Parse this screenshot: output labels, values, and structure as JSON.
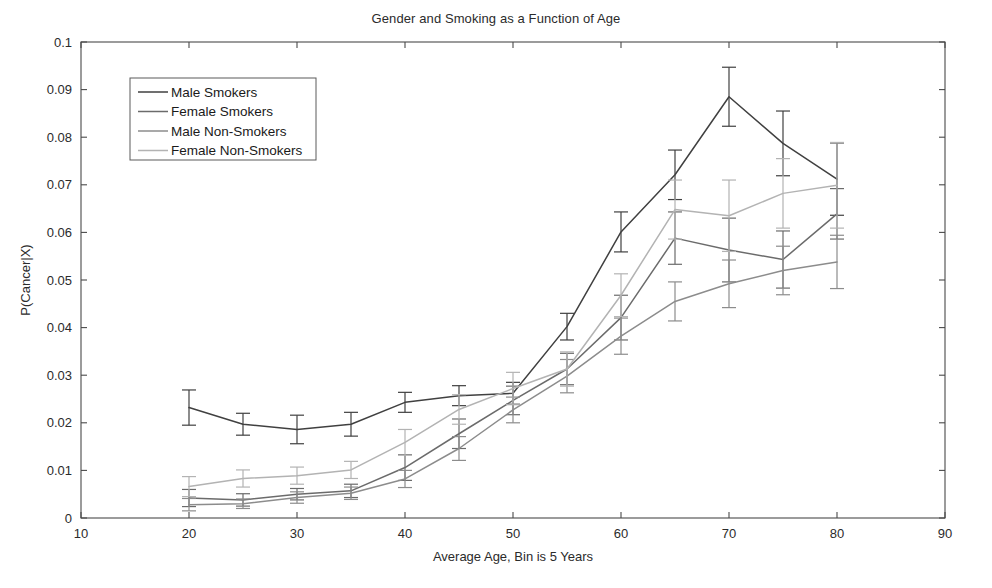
{
  "chart_data": {
    "type": "line",
    "title": "Gender and Smoking as a Function of Age",
    "xlabel": "Average Age, Bin is 5 Years",
    "ylabel": "P(Cancer|X)",
    "xlim": [
      10,
      90
    ],
    "ylim": [
      0,
      0.1
    ],
    "xticks": [
      10,
      20,
      30,
      40,
      50,
      60,
      70,
      80,
      90
    ],
    "yticks": [
      0,
      0.01,
      0.02,
      0.03,
      0.04,
      0.05,
      0.06,
      0.07,
      0.08,
      0.09,
      0.1
    ],
    "xtick_labels": [
      "10",
      "20",
      "30",
      "40",
      "50",
      "60",
      "70",
      "80",
      "90"
    ],
    "ytick_labels": [
      "0",
      "0.01",
      "0.02",
      "0.03",
      "0.04",
      "0.05",
      "0.06",
      "0.07",
      "0.08",
      "0.09",
      "0.1"
    ],
    "grid": false,
    "legend_position": "upper left",
    "errorbars": true,
    "x": [
      20,
      25,
      30,
      35,
      40,
      45,
      50,
      55,
      60,
      65,
      70,
      75,
      80
    ],
    "series": [
      {
        "name": "Male Smokers",
        "color": "#404040",
        "values": [
          0.0232,
          0.0197,
          0.0186,
          0.0197,
          0.0243,
          0.0257,
          0.0262,
          0.0402,
          0.0601,
          0.0721,
          0.0885,
          0.0787,
          0.0712
        ],
        "errors": [
          0.0037,
          0.0023,
          0.003,
          0.0025,
          0.0021,
          0.0021,
          0.0023,
          0.0028,
          0.0042,
          0.0052,
          0.0062,
          0.0068,
          0.0076
        ]
      },
      {
        "name": "Female Smokers",
        "color": "#6b6b6b",
        "values": [
          0.0042,
          0.0038,
          0.005,
          0.0057,
          0.0106,
          0.0177,
          0.0247,
          0.0313,
          0.0421,
          0.0588,
          0.0563,
          0.0543,
          0.0639
        ],
        "errors": [
          0.0018,
          0.0013,
          0.0012,
          0.0014,
          0.0027,
          0.0031,
          0.003,
          0.0033,
          0.0047,
          0.0055,
          0.0067,
          0.006,
          0.0053
        ]
      },
      {
        "name": "Male Non-Smokers",
        "color": "#8c8c8c",
        "values": [
          0.0028,
          0.003,
          0.0043,
          0.0052,
          0.0082,
          0.0146,
          0.0227,
          0.0298,
          0.0382,
          0.0455,
          0.0492,
          0.052,
          0.0538
        ],
        "errors": [
          0.0013,
          0.001,
          0.0012,
          0.0013,
          0.0018,
          0.0025,
          0.0027,
          0.0035,
          0.0038,
          0.0041,
          0.005,
          0.0051,
          0.0056
        ]
      },
      {
        "name": "Female Non-Smokers",
        "color": "#b3b3b3",
        "values": [
          0.0066,
          0.0083,
          0.0089,
          0.0101,
          0.0159,
          0.0228,
          0.0272,
          0.0313,
          0.0468,
          0.0648,
          0.0635,
          0.0682,
          0.0699
        ],
        "errors": [
          0.0021,
          0.0018,
          0.0018,
          0.0018,
          0.0027,
          0.0031,
          0.0034,
          0.0036,
          0.0045,
          0.0062,
          0.0075,
          0.0073,
          0.009
        ]
      }
    ]
  },
  "legend": {
    "items": [
      {
        "label": "Male Smokers"
      },
      {
        "label": "Female Smokers"
      },
      {
        "label": "Male Non-Smokers"
      },
      {
        "label": "Female Non-Smokers"
      }
    ]
  }
}
